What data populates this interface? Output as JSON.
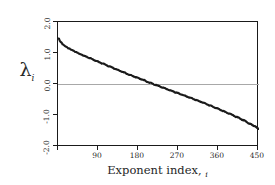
{
  "chart_data": {
    "type": "line",
    "title": "",
    "xlabel": "Exponent index, i",
    "ylabel": "λ",
    "ylabel_subscript": "i",
    "xlim": [
      0,
      450
    ],
    "ylim": [
      -2.0,
      2.0
    ],
    "grid": false,
    "zero_reference_line": true,
    "legend": null,
    "xticks": [
      90,
      180,
      270,
      360,
      450
    ],
    "xtick_labels": [
      "90",
      "180",
      "270",
      "360",
      "450"
    ],
    "yticks": [
      2.0,
      1.0,
      0.0,
      -1.0,
      -2.0
    ],
    "ytick_labels": [
      "2.0",
      "1.0",
      "0.0",
      "-1.0",
      "-2.0"
    ],
    "series_name": "Lyapunov exponent spectrum",
    "line_color": "#1a1a1a",
    "zero_line_color": "#a8a8a8",
    "frame_color": "#1a1a1a",
    "x": [
      1,
      6,
      12,
      18,
      25,
      32,
      40,
      50,
      60,
      72,
      85,
      100,
      115,
      130,
      145,
      160,
      175,
      190,
      205,
      220,
      235,
      250,
      265,
      280,
      295,
      310,
      325,
      340,
      355,
      370,
      385,
      400,
      415,
      430,
      440,
      450
    ],
    "values": [
      1.48,
      1.36,
      1.27,
      1.21,
      1.15,
      1.1,
      1.04,
      0.97,
      0.91,
      0.84,
      0.76,
      0.67,
      0.58,
      0.49,
      0.4,
      0.31,
      0.23,
      0.15,
      0.06,
      -0.02,
      -0.1,
      -0.18,
      -0.26,
      -0.34,
      -0.42,
      -0.5,
      -0.58,
      -0.67,
      -0.76,
      -0.85,
      -0.94,
      -1.04,
      -1.14,
      -1.26,
      -1.33,
      -1.42
    ]
  },
  "axes": {
    "y_label_text": "λ",
    "y_label_subscript": "i",
    "x_title_main": "Exponent index,",
    "x_title_subscript": "i"
  }
}
